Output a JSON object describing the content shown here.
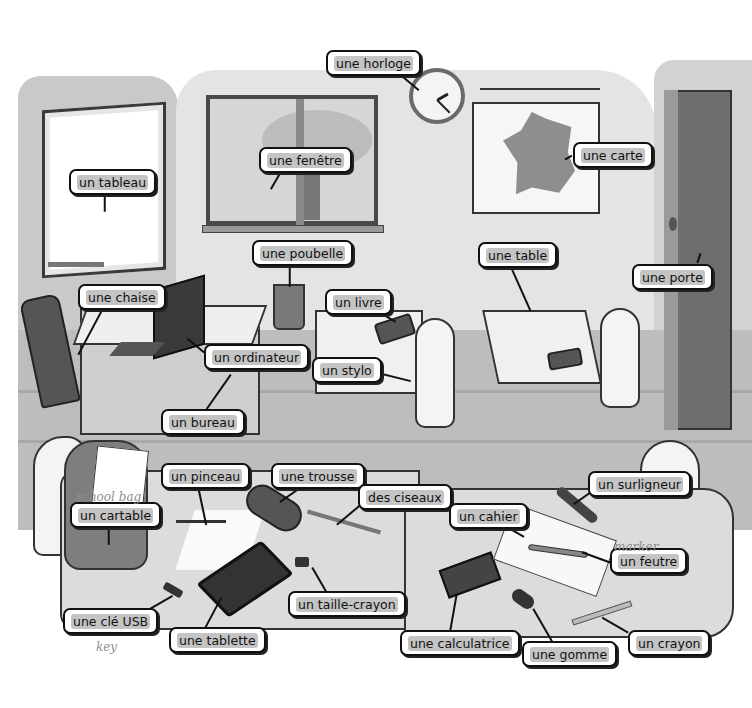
{
  "scene": {
    "title": "la salle de classe",
    "colors": {
      "label_bg": "#ffffff",
      "label_border": "#111111",
      "highlight": "#c4c4c4",
      "wall": "#e4e4e4",
      "floor": "#bdbdbd"
    }
  },
  "labels": [
    {
      "id": "horloge",
      "text": "une horloge",
      "x": 326,
      "y": 50,
      "w": 72
    },
    {
      "id": "fenetre",
      "text": "une fenêtre",
      "x": 259,
      "y": 147,
      "w": 76
    },
    {
      "id": "tableau",
      "text": "un tableau",
      "x": 69,
      "y": 169,
      "w": 72
    },
    {
      "id": "carte",
      "text": "une carte",
      "x": 573,
      "y": 142,
      "w": 70
    },
    {
      "id": "poubelle",
      "text": "une poubelle",
      "x": 252,
      "y": 240,
      "w": 80
    },
    {
      "id": "table",
      "text": "une table",
      "x": 478,
      "y": 242,
      "w": 62
    },
    {
      "id": "porte",
      "text": "une porte",
      "x": 632,
      "y": 264,
      "w": 67
    },
    {
      "id": "chaise",
      "text": "une chaise",
      "x": 78,
      "y": 284,
      "w": 70
    },
    {
      "id": "livre",
      "text": "un livre",
      "x": 325,
      "y": 289,
      "w": 52
    },
    {
      "id": "ordinateur",
      "text": "un ordinateur",
      "x": 204,
      "y": 344,
      "w": 88
    },
    {
      "id": "stylo",
      "text": "un stylo",
      "x": 312,
      "y": 357,
      "w": 58
    },
    {
      "id": "bureau",
      "text": "un bureau",
      "x": 161,
      "y": 409,
      "w": 70
    },
    {
      "id": "pinceau",
      "text": "un pinceau",
      "x": 161,
      "y": 463,
      "w": 72
    },
    {
      "id": "trousse",
      "text": "une trousse",
      "x": 271,
      "y": 463,
      "w": 78
    },
    {
      "id": "ciseaux",
      "text": "des ciseaux",
      "x": 358,
      "y": 484,
      "w": 78
    },
    {
      "id": "surligneur",
      "text": "un surligneur",
      "x": 588,
      "y": 471,
      "w": 86
    },
    {
      "id": "cartable",
      "text": "un cartable",
      "x": 70,
      "y": 502,
      "w": 76
    },
    {
      "id": "cahier",
      "text": "un cahier",
      "x": 449,
      "y": 503,
      "w": 64
    },
    {
      "id": "feutre",
      "text": "un feutre",
      "x": 610,
      "y": 548,
      "w": 64
    },
    {
      "id": "taille_crayon",
      "text": "un taille-crayon",
      "x": 288,
      "y": 591,
      "w": 100
    },
    {
      "id": "cle_usb",
      "text": "une clé USB",
      "x": 63,
      "y": 608,
      "w": 80
    },
    {
      "id": "tablette",
      "text": "une tablette",
      "x": 169,
      "y": 627,
      "w": 80
    },
    {
      "id": "calculatrice",
      "text": "une calculatrice",
      "x": 400,
      "y": 630,
      "w": 98
    },
    {
      "id": "crayon",
      "text": "un crayon",
      "x": 628,
      "y": 630,
      "w": 70
    },
    {
      "id": "gomme",
      "text": "une gomme",
      "x": 522,
      "y": 641,
      "w": 70
    }
  ],
  "handwritten_notes": [
    {
      "text": "school bag",
      "x": 76,
      "y": 496
    },
    {
      "text": "marker",
      "x": 612,
      "y": 546
    },
    {
      "text": "key",
      "x": 96,
      "y": 642
    }
  ]
}
